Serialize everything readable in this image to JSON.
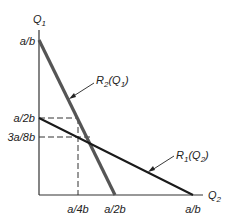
{
  "axes": {
    "y_label": "Q",
    "y_label_sub": "1",
    "x_label": "Q",
    "x_label_sub": "2"
  },
  "y_ticks": {
    "top": "a/b",
    "mid": "a/2b",
    "low": "3a/8b"
  },
  "x_ticks": {
    "first": "a/4b",
    "second": "a/2b",
    "third": "a/b"
  },
  "curves": {
    "r2": {
      "label_pre": "R",
      "label_sub": "2",
      "label_arg_pre": "(Q",
      "label_arg_sub": "1",
      "label_post": ")"
    },
    "r1": {
      "label_pre": "R",
      "label_sub": "1",
      "label_arg_pre": "(Q",
      "label_arg_sub": "2",
      "label_post": ")"
    }
  },
  "colors": {
    "r2_line": "#555555",
    "r1_line": "#1a1a1a",
    "axis": "#333333",
    "dashed": "#333333"
  }
}
